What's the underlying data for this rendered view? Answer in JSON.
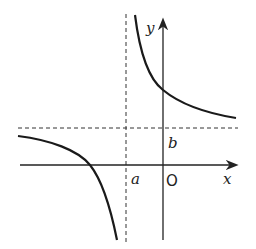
{
  "diagram": {
    "type": "function-graph",
    "labels": {
      "x_axis": "x",
      "y_axis": "y",
      "origin": "O",
      "vertical_asymptote": "a",
      "horizontal_asymptote": "b"
    },
    "colors": {
      "axis": "#222222",
      "curve": "#1a1a1a",
      "asymptote": "#333333",
      "background": "#ffffff"
    }
  }
}
